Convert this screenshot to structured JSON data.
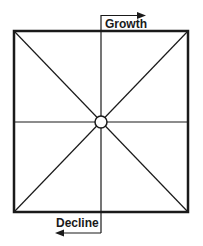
{
  "diagram": {
    "type": "square-with-eight-spokes",
    "labels": {
      "top": "Growth",
      "bottom": "Decline"
    },
    "arrows": {
      "top": {
        "label": "Growth",
        "direction": "right"
      },
      "bottom": {
        "label": "Decline",
        "direction": "left"
      }
    },
    "colors": {
      "stroke": "#1a1a1a",
      "background": "#ffffff"
    }
  }
}
